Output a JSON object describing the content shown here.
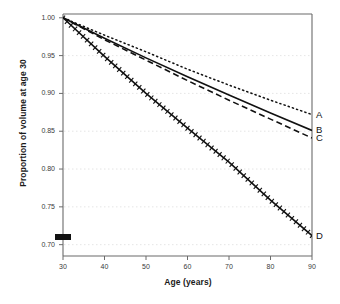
{
  "chart_data": {
    "type": "line",
    "title": "",
    "xlabel": "Age (years)",
    "ylabel": "Proportion of volume at age 30",
    "xlim": [
      30,
      90
    ],
    "ylim": [
      0.685,
      1.005
    ],
    "xticks": [
      30,
      40,
      50,
      60,
      70,
      80,
      90
    ],
    "xtick_labels": [
      "30",
      "40",
      "50",
      "60",
      "70",
      "80",
      "90"
    ],
    "yticks": [
      0.7,
      0.75,
      0.8,
      0.85,
      0.9,
      0.95,
      1.0
    ],
    "ytick_labels": [
      "0.70",
      "0.75",
      "0.80",
      "0.85",
      "0.90",
      "0.95",
      "1.00"
    ],
    "grid": true,
    "grid_axis": "y",
    "legend": "inline-right-labels",
    "x": [
      30,
      40,
      50,
      60,
      70,
      80,
      90
    ],
    "series": [
      {
        "name": "A",
        "label": "A",
        "style": "dotted",
        "color": "#111111",
        "values": [
          1.0,
          0.977,
          0.955,
          0.932,
          0.911,
          0.891,
          0.872
        ]
      },
      {
        "name": "B",
        "label": "B",
        "style": "solid",
        "color": "#111111",
        "values": [
          1.0,
          0.973,
          0.947,
          0.922,
          0.898,
          0.874,
          0.851
        ]
      },
      {
        "name": "C",
        "label": "C",
        "style": "dashed",
        "color": "#111111",
        "values": [
          1.0,
          0.971,
          0.944,
          0.917,
          0.891,
          0.866,
          0.841
        ]
      },
      {
        "name": "D",
        "label": "D",
        "style": "hatched",
        "color": "#111111",
        "values": [
          1.0,
          0.949,
          0.9,
          0.854,
          0.809,
          0.759,
          0.712
        ]
      }
    ],
    "annotations": [
      {
        "name": "y-axis-marker",
        "shape": "filled-rectangle",
        "x": 30,
        "y": 0.685,
        "color": "#111111"
      }
    ]
  }
}
